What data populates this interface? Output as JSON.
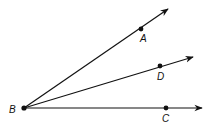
{
  "diagram": {
    "type": "angle-rays",
    "vertex": {
      "label": "B",
      "x": 24,
      "y": 108,
      "label_x": 9,
      "label_y": 113
    },
    "rays": [
      {
        "name": "ray-BA",
        "point_label": "A",
        "point": [
          141,
          29
        ],
        "tip": [
          168,
          9
        ],
        "label_pos": [
          140,
          42
        ]
      },
      {
        "name": "ray-BD",
        "point_label": "D",
        "point": [
          160,
          66
        ],
        "tip": [
          193,
          57
        ],
        "label_pos": [
          157,
          80
        ]
      },
      {
        "name": "ray-BC",
        "point_label": "C",
        "point": [
          166,
          108
        ],
        "tip": [
          202,
          108
        ],
        "label_pos": [
          162,
          122
        ]
      }
    ],
    "stroke_color": "#111111"
  },
  "labels": {
    "B": "B",
    "A": "A",
    "D": "D",
    "C": "C"
  }
}
